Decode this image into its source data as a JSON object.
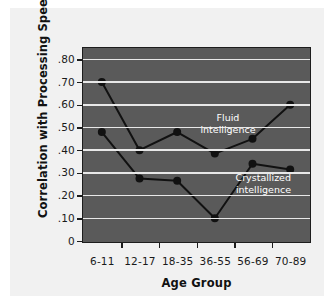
{
  "chart_data": {
    "type": "line",
    "title": "",
    "xlabel": "Age Group",
    "ylabel": "Correlation with Processing Speed",
    "categories": [
      "6-11",
      "12-17",
      "18-35",
      "36-55",
      "56-69",
      "70-89"
    ],
    "ylim": [
      0,
      0.85
    ],
    "yticks": [
      0,
      0.1,
      0.2,
      0.3,
      0.4,
      0.5,
      0.6,
      0.7,
      0.8
    ],
    "ytick_labels": [
      "0",
      ".10",
      ".20",
      ".30",
      ".40",
      ".50",
      ".60",
      ".70",
      ".80"
    ],
    "grid": true,
    "legend": "inline-annotations",
    "series": [
      {
        "name": "Fluid intelligence",
        "values": [
          0.7,
          0.4,
          0.48,
          0.385,
          0.45,
          0.6
        ]
      },
      {
        "name": "Crystallized intelligence",
        "values": [
          0.48,
          0.275,
          0.265,
          0.1,
          0.34,
          0.315
        ]
      }
    ],
    "annotations": [
      {
        "name": "fluid",
        "text": "Fluid\nintelligence"
      },
      {
        "name": "crystallized",
        "text": "Crystallized\nintelligence"
      }
    ],
    "colors": {
      "panel_background": "#5a5a5a",
      "figure_background": "#f1f1f1",
      "gridline": "#e8e8e8",
      "series_line": "#111111",
      "marker": "#111111",
      "axis": "#1d1d1d",
      "annotation_text": "#ffffff",
      "tick_text": "#1a1a1a"
    }
  }
}
